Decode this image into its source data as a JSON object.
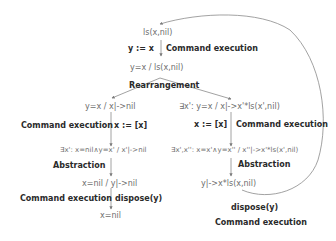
{
  "diagram": {
    "nodes": {
      "root": "ls(x,nil)",
      "after_assign": "y=x / ls(x,nil)",
      "left_rearr": "y=x / x|->nil",
      "right_rearr": "∃x': y=x  /  x|->x'*ls(x',nil)",
      "left_exec": "∃x': x=nil∧y=x' / x'|->nil",
      "right_exec": "∃x',x'': x=x'∧y=x'' / x''|->x'*ls(x',nil)",
      "left_abs": "x=nil / y|->nil",
      "right_abs": "y|->x*ls(x,nil)",
      "left_final": "x=nil"
    },
    "labels": {
      "top_command": "y := x",
      "top_step": "Command execution",
      "rearrangement": "Rearrangement",
      "left_step_exec": "Command execution",
      "left_command": "x := [x]",
      "right_command": "x := [x]",
      "right_step_exec": "Command execution",
      "left_abstraction": "Abstraction",
      "right_abstraction": "Abstraction",
      "left_step_dispose": "Command execution",
      "left_dispose": "dispose(y)",
      "loop_dispose": "dispose(y)",
      "loop_step": "Command execution"
    },
    "colors": {
      "formula_text": "#6e6e6e",
      "label_text": "#2a2a2a",
      "edge": "#7a7a7a"
    }
  }
}
